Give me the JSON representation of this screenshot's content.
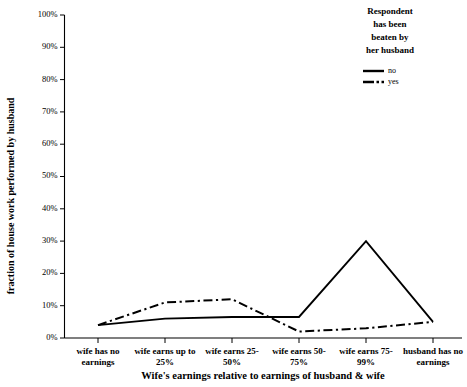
{
  "chart_data": {
    "type": "line",
    "title": "",
    "xlabel": "Wife's earnings relative to earnings of husband & wife",
    "ylabel": "fraction of house work performed by husband",
    "categories": [
      "wife has no earnings",
      "wife earns up to 25%",
      "wife earns 25-50%",
      "wife earns 50-75%",
      "wife earns 75-99%",
      "husband has no earnings"
    ],
    "series": [
      {
        "name": "no",
        "style": "solid",
        "values": [
          4,
          6,
          6.5,
          6.5,
          30,
          5
        ]
      },
      {
        "name": "yes",
        "style": "dash-dot",
        "values": [
          4,
          11,
          12,
          2,
          3,
          5
        ]
      }
    ],
    "ylim": [
      0,
      100
    ],
    "ytick_labels": [
      "0%",
      "10%",
      "20%",
      "30%",
      "40%",
      "50%",
      "60%",
      "70%",
      "80%",
      "90%",
      "100%"
    ],
    "ytick_values": [
      0,
      10,
      20,
      30,
      40,
      50,
      60,
      70,
      80,
      90,
      100
    ],
    "grid": false,
    "legend_position": "top-right",
    "legend": {
      "title_lines": [
        "Respondent",
        "has been",
        "beaten by",
        "her husband"
      ],
      "entries": [
        {
          "label": "no",
          "style": "solid"
        },
        {
          "label": "yes",
          "style": "dash-dot"
        }
      ]
    },
    "line_color": "#000000",
    "background_color": "#ffffff"
  }
}
